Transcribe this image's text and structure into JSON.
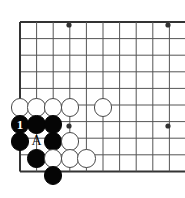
{
  "figure": {
    "kind": "go-board-diagram",
    "board": {
      "grid_spacing_px": 16.6,
      "origin_x_px": 20,
      "origin_y_px": 22,
      "left_edge_col": 1,
      "bottom_edge_row": 10,
      "cols": 10,
      "rows": 10,
      "line_color": "#555555",
      "edge_color": "#333333",
      "background_color": "#ffffff",
      "edge_line_width_px": 2.0,
      "inner_line_width_px": 1.0,
      "star_point_radius_px": 2.6,
      "star_points": [
        {
          "col": 4,
          "row": 1,
          "x": 69,
          "y": 25
        },
        {
          "col": 10,
          "row": 1,
          "x": 168,
          "y": 25
        },
        {
          "col": 4,
          "row": 7,
          "x": 69,
          "y": 126
        },
        {
          "col": 10,
          "row": 7,
          "x": 168,
          "y": 126
        }
      ]
    },
    "stone_radius_px": 9.2,
    "stones": [
      {
        "id": "w1",
        "color": "white",
        "col": 1,
        "row": 6,
        "x": 20,
        "y": 107.5
      },
      {
        "id": "w2",
        "color": "white",
        "col": 2,
        "row": 6,
        "x": 36.6,
        "y": 107.5
      },
      {
        "id": "w3",
        "color": "white",
        "col": 3,
        "row": 6,
        "x": 53.2,
        "y": 107.5
      },
      {
        "id": "w4",
        "color": "white",
        "col": 4,
        "row": 6,
        "x": 69.8,
        "y": 107.5
      },
      {
        "id": "w5",
        "color": "white",
        "col": 6,
        "row": 6,
        "x": 103,
        "y": 107.5
      },
      {
        "id": "b1",
        "color": "black",
        "col": 1,
        "row": 7,
        "x": 20,
        "y": 124.5
      },
      {
        "id": "b2",
        "color": "black",
        "col": 2,
        "row": 7,
        "x": 36.6,
        "y": 124.5
      },
      {
        "id": "b3",
        "color": "black",
        "col": 3,
        "row": 7,
        "x": 53.2,
        "y": 124.5
      },
      {
        "id": "b4",
        "color": "black",
        "col": 1,
        "row": 8,
        "x": 20,
        "y": 141.5
      },
      {
        "id": "b5",
        "color": "black",
        "col": 3,
        "row": 8,
        "x": 53.2,
        "y": 141.5
      },
      {
        "id": "w6",
        "color": "white",
        "col": 4,
        "row": 8,
        "x": 69.8,
        "y": 141.5
      },
      {
        "id": "b6",
        "color": "black",
        "col": 2,
        "row": 9,
        "x": 36.6,
        "y": 158.5
      },
      {
        "id": "w7",
        "color": "white",
        "col": 3,
        "row": 9,
        "x": 53.2,
        "y": 158.5
      },
      {
        "id": "w8",
        "color": "white",
        "col": 4,
        "row": 9,
        "x": 69.8,
        "y": 158.5
      },
      {
        "id": "w9",
        "color": "white",
        "col": 5,
        "row": 9,
        "x": 86.4,
        "y": 158.5
      },
      {
        "id": "b7",
        "color": "black",
        "col": 3,
        "row": 10,
        "x": 53.2,
        "y": 175.5
      }
    ],
    "markers": [
      {
        "id": "move-1",
        "label": "1",
        "on": "black",
        "col": 1,
        "row": 7,
        "x": 20,
        "y": 124.5,
        "font_size_px": 13,
        "bold": true
      },
      {
        "id": "point-a",
        "label": "A",
        "on": "empty",
        "col": 2,
        "row": 8,
        "x": 36.6,
        "y": 141.5,
        "font_size_px": 14,
        "bold": false
      }
    ]
  }
}
